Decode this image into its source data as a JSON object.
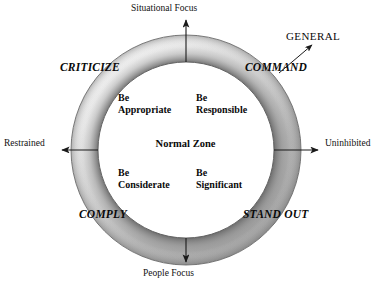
{
  "diagram": {
    "center_label": "Normal Zone",
    "axes": {
      "top": {
        "label": "Situational Focus",
        "direction": "up"
      },
      "bottom": {
        "label": "People Focus",
        "direction": "down"
      },
      "left": {
        "label": "Restrained",
        "direction": "left"
      },
      "right": {
        "label": "Uninhibited",
        "direction": "right"
      }
    },
    "quadrant_labels": [
      {
        "id": "criticize",
        "text": "CRITICIZE",
        "position": "top-left"
      },
      {
        "id": "command",
        "text": "COMMAND",
        "position": "top-right"
      },
      {
        "id": "comply",
        "text": "COMPLY",
        "position": "bottom-left"
      },
      {
        "id": "stand-out",
        "text": "STAND OUT",
        "position": "bottom-right"
      }
    ],
    "inner_labels": [
      {
        "id": "be-appropriate",
        "line1": "Be",
        "line2": "Appropriate",
        "position": "top-left"
      },
      {
        "id": "be-responsible",
        "line1": "Be",
        "line2": "Responsible",
        "position": "top-right"
      },
      {
        "id": "be-considerate",
        "line1": "Be",
        "line2": "Considerate",
        "position": "bottom-left"
      },
      {
        "id": "be-significant",
        "line1": "Be",
        "line2": "Significant",
        "position": "bottom-right"
      }
    ],
    "callout": {
      "label": "GENERAL",
      "points_from": "COMMAND",
      "direction": "up-right"
    },
    "colors": {
      "background": "#ffffff",
      "text": "#111111",
      "ring_shadow": "#6e6e6e",
      "ring_highlight": "#ffffff",
      "ring_outline": "#555555",
      "arrow": "#1a1a1a"
    }
  }
}
